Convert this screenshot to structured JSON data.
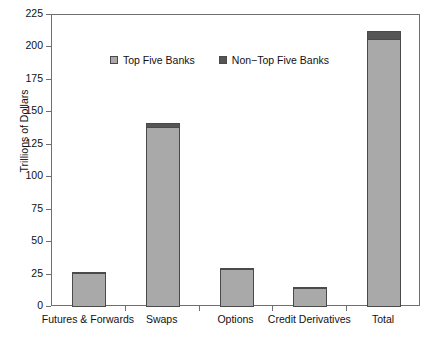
{
  "chart_data": {
    "type": "bar",
    "title": "",
    "subtitle": "",
    "xlabel": "",
    "ylabel": "Trillions of Dollars",
    "ylim": [
      0,
      225
    ],
    "ytick_step": 25,
    "yticks": [
      "0",
      "25",
      "50",
      "75",
      "100",
      "125",
      "150",
      "175",
      "200",
      "225"
    ],
    "grid": false,
    "stacked": true,
    "legend_position": "inside-upper-left",
    "categories": [
      "Futures & Forwards",
      "Swaps",
      "Options",
      "Credit Derivatives",
      "Total"
    ],
    "series": [
      {
        "name": "Top Five Banks",
        "color": "#a9a9a9",
        "values": [
          25.5,
          138.0,
          29.0,
          14.2,
          206.0
        ]
      },
      {
        "name": "Non-Top Five Banks",
        "color": "#555555",
        "values": [
          1.5,
          4.0,
          1.3,
          1.0,
          7.0
        ]
      }
    ],
    "totals": [
      27.0,
      142.0,
      30.3,
      15.2,
      213.0
    ]
  },
  "legend": {
    "items": [
      {
        "label": "Top Five Banks",
        "color": "#a9a9a9"
      },
      {
        "label": "Non−Top Five Banks",
        "color": "#555555"
      }
    ]
  },
  "axes": {
    "y_axis_title": "Trillions of Dollars",
    "frame_color": "#6f6f6f",
    "bar_edge_color": "#4a4a4a"
  }
}
